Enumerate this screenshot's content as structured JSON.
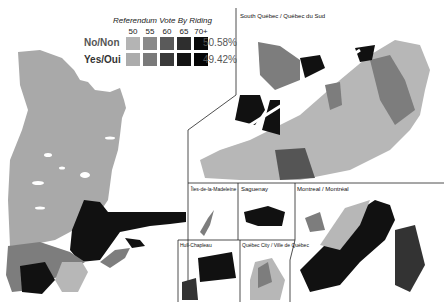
{
  "legend": {
    "title": "Referendum Vote By Riding",
    "ticks": [
      "50",
      "55",
      "60",
      "65",
      "70+"
    ],
    "rows": [
      {
        "label": "No/Non",
        "percent": "50.58%",
        "colors": [
          "#b4b4b4",
          "#8a8a8a",
          "#5a5a5a",
          "#2e2e2e",
          "#0a0a0a"
        ]
      },
      {
        "label": "Yes/Oui",
        "percent": "49.42%",
        "colors": [
          "#acacac",
          "#7a7a7a",
          "#3a3a3a",
          "#141414",
          "#050505"
        ]
      }
    ]
  },
  "panels": {
    "south": "South Québec / Québec du Sud",
    "madeleine": "Îles-de-la-Madeleine",
    "saguenay": "Saguenay",
    "montreal": "Montreal / Montréal",
    "hull": "Hull-Chapleau",
    "quebec_city": "Québec City / Ville de Québec"
  },
  "colors": {
    "north_region": "#a9a9a9",
    "dark": "#111111",
    "mid": "#7d7d7d",
    "light": "#b7b7b7",
    "border": "#222222"
  }
}
